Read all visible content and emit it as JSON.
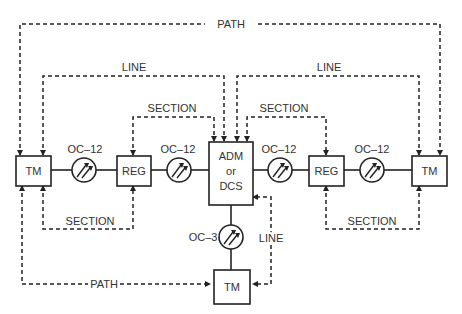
{
  "nodes": {
    "tm_left": "TM",
    "reg_left": "REG",
    "adm_line1": "ADM",
    "adm_line2": "or",
    "adm_line3": "DCS",
    "reg_right": "REG",
    "tm_right": "TM",
    "tm_bottom": "TM"
  },
  "links": {
    "oc12_1": "OC–12",
    "oc12_2": "OC–12",
    "oc12_3": "OC–12",
    "oc12_4": "OC–12",
    "oc3": "OC–3"
  },
  "overhead": {
    "path_top": "PATH",
    "line_left": "LINE",
    "line_right": "LINE",
    "section_top_left": "SECTION",
    "section_top_right": "SECTION",
    "section_bottom_left": "SECTION",
    "section_bottom_right": "SECTION",
    "line_vertical": "LINE",
    "path_bottom": "PATH"
  }
}
